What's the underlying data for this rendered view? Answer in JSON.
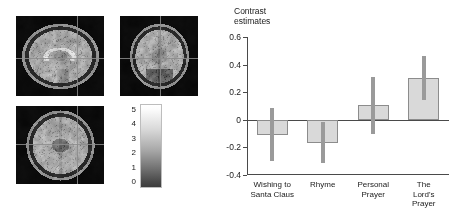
{
  "figure": {
    "brain": {
      "slices": [
        {
          "name": "sagittal",
          "crosshair_x_pct": 69,
          "crosshair_y_pct": 52
        },
        {
          "name": "coronal",
          "crosshair_x_pct": 51,
          "crosshair_y_pct": 53
        },
        {
          "name": "axial",
          "crosshair_x_pct": 69,
          "crosshair_y_pct": 49
        }
      ],
      "colorbar": {
        "name": "statistic-colorbar",
        "ticks": [
          "5",
          "4",
          "3",
          "2",
          "1",
          "0"
        ],
        "min": 0,
        "max": 5,
        "high_color": "#ffffff",
        "low_color": "#3c3c3c"
      }
    }
  },
  "chart_data": {
    "type": "bar",
    "title": "Contrast\nestimates",
    "xlabel": "",
    "ylabel": "",
    "ylim": [
      -0.4,
      0.6
    ],
    "yticks": [
      0.6,
      0.4,
      0.2,
      0,
      -0.2,
      -0.4
    ],
    "ytick_labels": [
      "0.6",
      "0.4",
      "0.2",
      "0",
      "-0.2",
      "-0.4"
    ],
    "grid": false,
    "legend": null,
    "zero_line": 0,
    "categories": [
      "Wishing to\nSanta Claus",
      "Rhyme",
      "Personal\nPrayer",
      "The Lord's\nPrayer"
    ],
    "values": [
      -0.11,
      -0.165,
      0.11,
      0.3
    ],
    "errors_low": [
      -0.3,
      -0.315,
      -0.1,
      0.145
    ],
    "errors_high": [
      0.085,
      -0.015,
      0.31,
      0.465
    ],
    "bar_color": "#d9d9d9",
    "bar_edge_color": "#8c8c8c",
    "error_color": "#9a9a9a"
  }
}
